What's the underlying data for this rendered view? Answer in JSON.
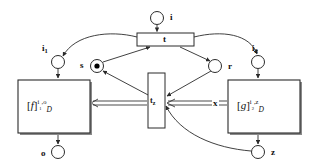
{
  "diagram": {
    "type": "petri-net",
    "title": "",
    "places": [
      {
        "id": "i",
        "label": "i",
        "cx": 157,
        "cy": 18,
        "r": 6.5,
        "tokens": 0,
        "label_x": 170,
        "label_y": 13
      },
      {
        "id": "i1",
        "label": "i",
        "sub": "1",
        "cx": 58,
        "cy": 62,
        "r": 6.5,
        "tokens": 0,
        "label_x": 42,
        "label_y": 44
      },
      {
        "id": "i2",
        "label": "i",
        "sub": "2",
        "cx": 258,
        "cy": 62,
        "r": 6.5,
        "tokens": 0,
        "label_x": 252,
        "label_y": 44
      },
      {
        "id": "s",
        "label": "s",
        "cx": 97,
        "cy": 66,
        "r": 6.5,
        "tokens": 1,
        "label_x": 80,
        "label_y": 61
      },
      {
        "id": "r",
        "label": "r",
        "cx": 215,
        "cy": 66,
        "r": 6.5,
        "tokens": 0,
        "label_x": 228,
        "label_y": 61
      },
      {
        "id": "o",
        "label": "o",
        "cx": 58,
        "cy": 152,
        "r": 6.5,
        "tokens": 0,
        "label_x": 41,
        "label_y": 148
      },
      {
        "id": "z",
        "label": "z",
        "cx": 258,
        "cy": 152,
        "r": 6.5,
        "tokens": 0,
        "label_x": 271,
        "label_y": 147
      }
    ],
    "transitions": [
      {
        "id": "t",
        "label": "t",
        "x": 137,
        "y": 33,
        "w": 57,
        "h": 13,
        "orientation": "horizontal",
        "label_x": 163,
        "label_y": 35
      },
      {
        "id": "tz",
        "label": "t",
        "sub": "z",
        "x": 148,
        "y": 73,
        "w": 17,
        "h": 55,
        "orientation": "vertical",
        "label_x": 150,
        "label_y": 99
      }
    ],
    "subnets": [
      {
        "id": "f_box",
        "x": 18,
        "y": 80,
        "w": 72,
        "h": 53,
        "name": "f",
        "sub": "D",
        "sup": "i",
        "sup_sub": "1",
        "sup_tail": ",o",
        "label_x": 27,
        "label_y": 99
      },
      {
        "id": "g_box",
        "x": 228,
        "y": 80,
        "w": 72,
        "h": 53,
        "name": "g",
        "sub": "D",
        "sup": "i",
        "sup_sub": "2",
        "sup_tail": ",z",
        "label_x": 237,
        "label_y": 99
      }
    ],
    "edge_annotations": [
      {
        "id": "x_mark",
        "label": "x",
        "x": 212,
        "y": 99
      }
    ],
    "arc_count": 14,
    "colors": {
      "stroke": "#2b2b2b",
      "fill": "#ffffff",
      "token": "#000000",
      "text": "#111111",
      "background": "#ffffff"
    }
  }
}
